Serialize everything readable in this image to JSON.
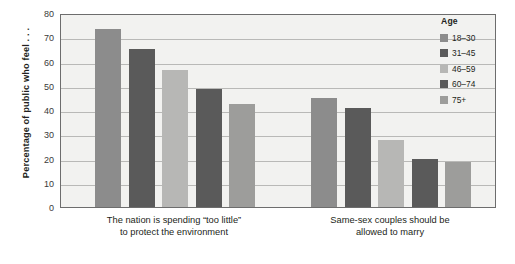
{
  "chart_data": {
    "type": "bar",
    "title": "",
    "xlabel": "",
    "ylabel": "Percentage of public who feel . . .",
    "ylim": [
      0,
      80
    ],
    "ytick_step": 10,
    "yticks": [
      "80",
      "70",
      "60",
      "50",
      "40",
      "30",
      "20",
      "10",
      "0"
    ],
    "grid": "horizontal",
    "legend_position": "right",
    "legend_title": "Age",
    "categories": [
      {
        "line1": "The nation is spending “too little”",
        "line2": "to protect the environment"
      },
      {
        "line1": "Same-sex couples should be",
        "line2": "allowed to marry"
      }
    ],
    "series": [
      {
        "name": "18–30",
        "color": "#8c8c8c",
        "values": [
          73.5,
          45.0
        ]
      },
      {
        "name": "31–45",
        "color": "#5a5a5a",
        "values": [
          65.0,
          41.0
        ]
      },
      {
        "name": "46–59",
        "color": "#b7b7b5",
        "values": [
          56.5,
          27.5
        ]
      },
      {
        "name": "60–74",
        "color": "#5a5a5a",
        "values": [
          48.5,
          20.0
        ]
      },
      {
        "name": "75+",
        "color": "#9d9d9b",
        "values": [
          42.5,
          18.5
        ]
      }
    ],
    "colors": {
      "plot_background": "#f2f2f0",
      "gridline": "#b9b9b7",
      "axis": "#6d6d6d",
      "text": "#231f20"
    }
  }
}
